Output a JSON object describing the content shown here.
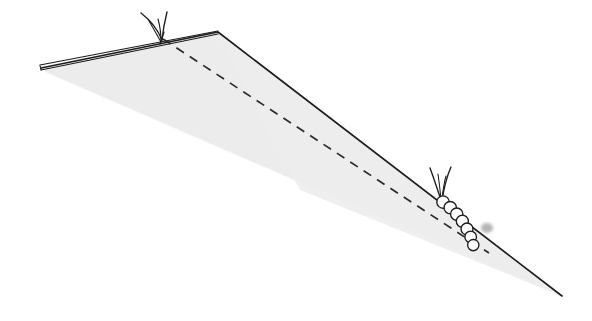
{
  "figure": {
    "canvas": {
      "width": 592,
      "height": 321,
      "background": "#ffffff"
    },
    "colors": {
      "background": "#ffffff",
      "plane_fill": "#ececec",
      "plane_fill_soft": "#f1f1f1",
      "stroke": "#1c1c1c",
      "stroke_soft": "#2b2b2b",
      "shadow": "#a9a9a9",
      "segment_fill": "#ffffff"
    },
    "plane": {
      "label": "shaded inclined plane",
      "fill": "#ececec",
      "vertices": [
        {
          "x": 42,
          "y": 69
        },
        {
          "x": 218,
          "y": 32
        },
        {
          "x": 562,
          "y": 296
        },
        {
          "x": 49,
          "y": 73
        }
      ]
    },
    "ridge_line": {
      "label": "solid ridge edge",
      "stroke": "#1c1c1c",
      "width": 1.6,
      "points": [
        {
          "x": 41,
          "y": 68
        },
        {
          "x": 218,
          "y": 32
        },
        {
          "x": 562,
          "y": 296
        }
      ]
    },
    "edge_strip": {
      "label": "thin folded edge strip",
      "stroke": "#1c1c1c",
      "width": 1.2,
      "upper": [
        {
          "x": 40,
          "y": 65
        },
        {
          "x": 218,
          "y": 31
        }
      ],
      "lower": [
        {
          "x": 41,
          "y": 70
        },
        {
          "x": 218,
          "y": 34
        }
      ]
    },
    "dashed_line": {
      "label": "dashed guide line",
      "stroke": "#2b2b2b",
      "width": 1.7,
      "dash_pattern": "9 7",
      "start": {
        "x": 163,
        "y": 39
      },
      "end": {
        "x": 489,
        "y": 253
      }
    },
    "caterpillars": [
      {
        "name": "upper-caterpillar",
        "position": {
          "x": 160,
          "y": 38
        },
        "visible_parts": "antennae only",
        "segment_count": 0,
        "antennae": 2,
        "has_shadow": false
      },
      {
        "name": "lower-caterpillar",
        "position": {
          "x": 441,
          "y": 200
        },
        "visible_parts": "head, antennae and body segments",
        "segment_count": 7,
        "antennae": 2,
        "has_shadow": true,
        "segment_radius": 6.2,
        "body_direction_degrees": 38
      }
    ],
    "shadow": {
      "label": "tail shadow blob",
      "center": {
        "x": 487,
        "y": 228
      },
      "rx": 6,
      "ry": 5,
      "fill": "#a9a9a9"
    }
  }
}
